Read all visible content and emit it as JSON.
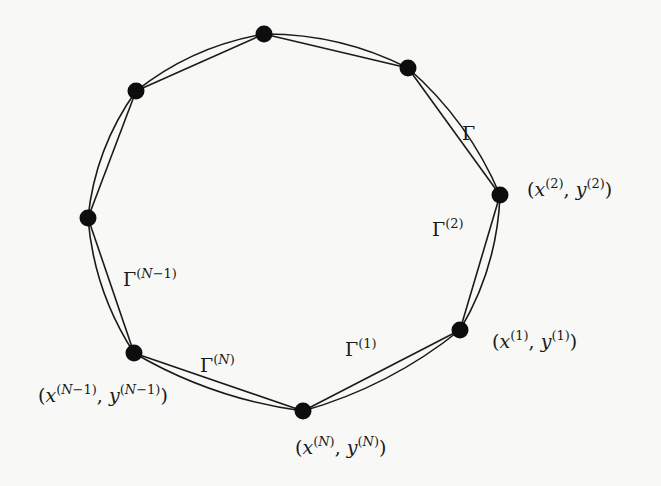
{
  "diagram": {
    "nodes": [
      {
        "id": "n2",
        "label_var_x": "x",
        "label_var_y": "y",
        "label_index": "2",
        "labeled": true
      },
      {
        "id": "n1",
        "label_var_x": "x",
        "label_var_y": "y",
        "label_index": "1",
        "labeled": true
      },
      {
        "id": "nN",
        "label_var_x": "x",
        "label_var_y": "y",
        "label_index": "N",
        "labeled": true
      },
      {
        "id": "nNm1",
        "label_var_x": "x",
        "label_var_y": "y",
        "label_index": "N−1",
        "labeled": true
      },
      {
        "id": "nLeft",
        "labeled": false
      },
      {
        "id": "nUpperLeft",
        "labeled": false
      },
      {
        "id": "nTop",
        "labeled": false
      },
      {
        "id": "nUpperRight",
        "labeled": false
      }
    ],
    "edges": [
      {
        "from": "nUpperRight",
        "to": "n2",
        "label": "Γ",
        "superscript": ""
      },
      {
        "from": "n2",
        "to": "n1",
        "label": "Γ",
        "superscript": "(2)"
      },
      {
        "from": "n1",
        "to": "nN",
        "label": "Γ",
        "superscript": "(1)"
      },
      {
        "from": "nN",
        "to": "nNm1",
        "label": "Γ",
        "superscript": "(N)"
      },
      {
        "from": "nNm1",
        "to": "nLeft",
        "label": "Γ",
        "superscript": "(N−1)"
      },
      {
        "from": "nLeft",
        "to": "nUpperLeft",
        "label": "",
        "superscript": ""
      },
      {
        "from": "nUpperLeft",
        "to": "nTop",
        "label": "",
        "superscript": ""
      },
      {
        "from": "nTop",
        "to": "nUpperRight",
        "label": "",
        "superscript": ""
      }
    ],
    "labels": {
      "gamma": {
        "base": "Γ"
      },
      "gamma2": {
        "base": "Γ",
        "sup": "(2)"
      },
      "gamma1": {
        "base": "Γ",
        "sup": "(1)"
      },
      "gammaN": {
        "base": "Γ",
        "sup": "(N)"
      },
      "gammaNm1": {
        "base": "Γ",
        "sup_open": "(",
        "sup_var": "N",
        "sup_rest": "−1)"
      },
      "point2": {
        "open": "(",
        "x": "x",
        "sup": "(2)",
        "comma": ", ",
        "y": "y",
        "close": ")"
      },
      "point1": {
        "open": "(",
        "x": "x",
        "sup": "(1)",
        "comma": ", ",
        "y": "y",
        "close": ")"
      },
      "pointN": {
        "open": "(",
        "x": "x",
        "sup_open": "(",
        "sup_var": "N",
        "sup_close": ")",
        "comma": ", ",
        "y": "y",
        "close": ")"
      },
      "pointNm1": {
        "open": "(",
        "x": "x",
        "sup_open": "(",
        "sup_var": "N",
        "sup_rest": "−1)",
        "comma": ", ",
        "y": "y",
        "close": ")"
      }
    },
    "colors": {
      "ink": "#1a1a1a",
      "node": "#0d0d0d",
      "background": "#f8f8f6"
    }
  }
}
